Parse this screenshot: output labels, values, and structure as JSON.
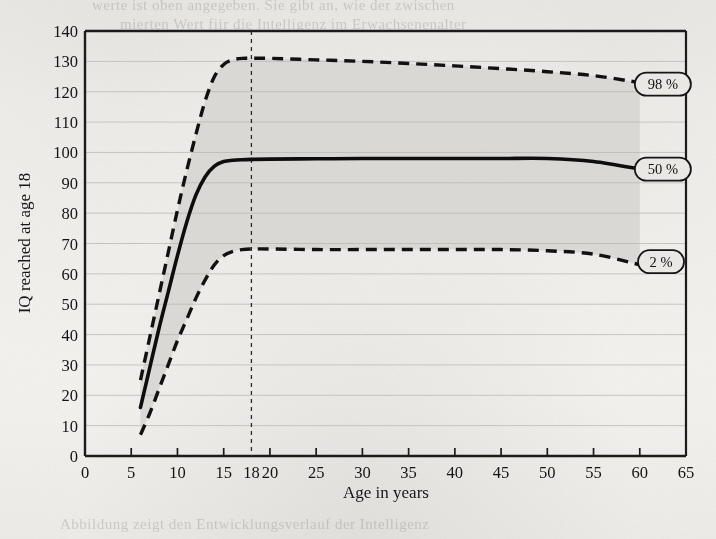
{
  "figure": {
    "background_color": "#f2f1ee",
    "ink_color": "#141414",
    "band_fill_color": "#d8d7d4",
    "gridline_color": "#b9b8b4"
  },
  "chart_data": {
    "type": "line",
    "title": "",
    "xlabel": "Age in years",
    "ylabel": "IQ reached at age 18",
    "xlim": [
      0,
      65
    ],
    "ylim": [
      0,
      140
    ],
    "x_ticks": [
      0,
      5,
      10,
      15,
      18,
      20,
      25,
      30,
      35,
      40,
      45,
      50,
      55,
      60,
      65
    ],
    "x_tick_labels": [
      "0",
      "5",
      "10",
      "15",
      "18",
      "20",
      "25",
      "30",
      "35",
      "40",
      "45",
      "50",
      "55",
      "60",
      "65"
    ],
    "y_ticks": [
      0,
      10,
      20,
      30,
      40,
      50,
      60,
      70,
      80,
      90,
      100,
      110,
      120,
      130,
      140
    ],
    "y_tick_labels": [
      "0",
      "10",
      "20",
      "30",
      "40",
      "50",
      "60",
      "70",
      "80",
      "90",
      "100",
      "110",
      "120",
      "130",
      "140"
    ],
    "grid": "horizontal",
    "legend_position": "inline-right-labels",
    "reference_lines": [
      {
        "name": "age-18-reference",
        "axis": "x",
        "value": 18,
        "style": "dashed"
      }
    ],
    "shaded_band": {
      "name": "2-to-98-percentile-band",
      "lower_series": "2 %",
      "upper_series": "98 %",
      "fill": "#d8d7d4"
    },
    "series": [
      {
        "name": "98 %",
        "label": "98 %",
        "style": "dashed",
        "x": [
          6,
          7,
          8,
          9,
          10,
          11,
          12,
          13,
          14,
          15,
          16,
          17,
          18,
          20,
          25,
          30,
          35,
          40,
          45,
          50,
          55,
          60
        ],
        "values": [
          25,
          39,
          53,
          67,
          81,
          94,
          106,
          117,
          125,
          129,
          130.5,
          131,
          131,
          131,
          130.5,
          130,
          129.3,
          128.5,
          127.6,
          126.6,
          125.3,
          123
        ]
      },
      {
        "name": "50 %",
        "label": "50 %",
        "style": "solid",
        "x": [
          6,
          7,
          8,
          9,
          10,
          11,
          12,
          13,
          14,
          15,
          16,
          17,
          18,
          20,
          25,
          30,
          35,
          40,
          45,
          50,
          55,
          60
        ],
        "values": [
          16,
          29,
          42,
          54,
          66,
          77,
          86,
          92,
          95.5,
          97,
          97.4,
          97.6,
          97.7,
          97.8,
          97.9,
          98,
          98,
          98,
          98,
          98,
          97,
          94.5
        ]
      },
      {
        "name": "2 %",
        "label": "2 %",
        "style": "dashed",
        "x": [
          6,
          7,
          8,
          9,
          10,
          11,
          12,
          13,
          14,
          15,
          16,
          17,
          18,
          20,
          25,
          30,
          35,
          40,
          45,
          50,
          55,
          60
        ],
        "values": [
          7,
          14,
          22,
          30,
          38,
          45,
          52,
          58,
          63,
          66,
          67.4,
          68,
          68.2,
          68.2,
          68,
          68,
          68,
          68,
          68,
          67.6,
          66.5,
          63
        ]
      }
    ],
    "annotations": [
      {
        "name": "badge-98",
        "text": "98 %",
        "x": 62.5,
        "y": 122.5
      },
      {
        "name": "badge-50",
        "text": "50 %",
        "x": 62.5,
        "y": 94.5
      },
      {
        "name": "badge-2",
        "text": "2 %",
        "x": 62.3,
        "y": 64.0
      }
    ]
  },
  "page_bleed_text": [
    "werte ist oben angegeben. Sie gibt an, wie der zwischen",
    "mierten Wert fiir die Intelligenz im Erwachsenenalter"
  ],
  "page_bleed_text_bottom": "Abbildung zeigt den Entwicklungsverlauf der Intelligenz"
}
